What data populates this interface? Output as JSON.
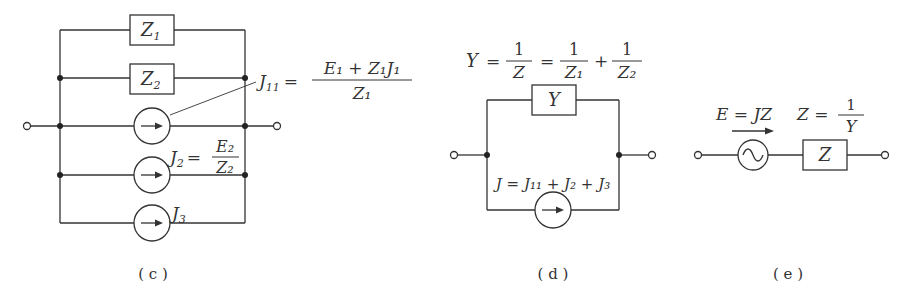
{
  "figures": [
    {
      "id": "c",
      "caption": "( c )",
      "elements": {
        "impedance_1": "Z",
        "impedance_1_sub": "1",
        "impedance_2": "Z",
        "impedance_2_sub": "2",
        "source_J11_label": "J",
        "source_J11_sub": "11",
        "source_J11_eq": "=",
        "source_J11_num": "E₁ + Z₁J₁",
        "source_J11_den": "Z₁",
        "source_J2_label": "J",
        "source_J2_sub": "2",
        "source_J2_eq": "=",
        "source_J2_num": "E₂",
        "source_J2_den": "Z₂",
        "source_J3_label": "J",
        "source_J3_sub": "3"
      }
    },
    {
      "id": "d",
      "caption": "( d )",
      "elements": {
        "admittance_eq": "Y = 1/Z = 1/Z₁ + 1/Z₂",
        "Y_label": "Y",
        "eq1": "=",
        "frac1_num": "1",
        "frac1_den": "Z",
        "eq2": "=",
        "frac2_num": "1",
        "frac2_den": "Z₁",
        "plus": "+",
        "frac3_num": "1",
        "frac3_den": "Z₂",
        "box_label": "Y",
        "source_label": "J = J₁₁ + J₂ + J₃"
      }
    },
    {
      "id": "e",
      "caption": "( e )",
      "elements": {
        "voltage_label": "E = JZ",
        "impedance_eq_left": "Z =",
        "impedance_eq_num": "1",
        "impedance_eq_den": "Y",
        "box_label": "Z"
      }
    }
  ]
}
